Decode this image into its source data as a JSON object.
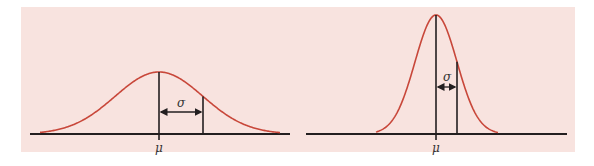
{
  "colors": {
    "background": "#ffffff",
    "panel": "#f8e3df",
    "curve": "#c8473a",
    "lines": "#231f20"
  },
  "chart_data": [
    {
      "type": "line",
      "title": "Normal distribution, larger standard deviation (wide, low curve)",
      "mean_label": "μ",
      "sd_label": "σ",
      "mean_x_px": 159,
      "sigma_px": 44,
      "peak_y_px": 72,
      "baseline_y_px": 134,
      "annotations": [
        "Vertical line at μ",
        "Vertical line at μ+σ",
        "Double arrow labeled σ between μ and μ+σ"
      ]
    },
    {
      "type": "line",
      "title": "Normal distribution, smaller standard deviation (narrow, tall curve)",
      "mean_label": "μ",
      "sd_label": "σ",
      "mean_x_px": 436,
      "sigma_px": 21,
      "peak_y_px": 15,
      "baseline_y_px": 134,
      "annotations": [
        "Vertical line at μ",
        "Vertical line at μ+σ",
        "Double arrow labeled σ between μ and μ+σ"
      ]
    }
  ],
  "left": {
    "mu_label": "μ",
    "sigma_label": "σ"
  },
  "right": {
    "mu_label": "μ",
    "sigma_label": "σ"
  }
}
